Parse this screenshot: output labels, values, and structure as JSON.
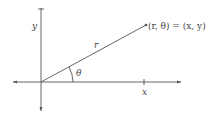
{
  "diagram": {
    "labels": {
      "y_axis": "y",
      "x_tick": "x",
      "radius": "r",
      "angle": "θ",
      "point": "(r, θ) = (x, y)"
    },
    "colors": {
      "line": "#555555",
      "text": "#444444"
    }
  }
}
